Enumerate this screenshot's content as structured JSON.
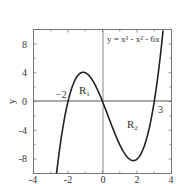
{
  "chart_data": {
    "type": "line",
    "title": "",
    "equation_label": "y = x³ - x² - 6x",
    "xlabel": "",
    "ylabel": "y",
    "xlim": [
      -4,
      4
    ],
    "ylim": [
      -10,
      10
    ],
    "xticks": [
      -4,
      -2,
      0,
      2,
      4
    ],
    "yticks": [
      -8,
      -4,
      0,
      4,
      8
    ],
    "xtick_labels": [
      "-4",
      "-2",
      "0",
      "2",
      "4"
    ],
    "ytick_labels": [
      "-8",
      "-4",
      "0",
      "4",
      "8"
    ],
    "grid": false,
    "series": [
      {
        "name": "y = x^3 - x^2 - 6x",
        "function": "x^3 - x^2 - 6x",
        "x": [
          -2.6,
          -2.4,
          -2.2,
          -2.0,
          -1.8,
          -1.6,
          -1.4,
          -1.2,
          -1.0,
          -0.8,
          -0.6,
          -0.4,
          -0.2,
          0.0,
          0.2,
          0.4,
          0.6,
          0.8,
          1.0,
          1.2,
          1.4,
          1.6,
          1.8,
          2.0,
          2.2,
          2.4,
          2.6,
          2.8,
          3.0,
          3.2,
          3.4
        ],
        "values": [
          -8.866,
          -5.184,
          -2.248,
          0.0,
          1.608,
          2.624,
          3.136,
          3.168,
          4.0,
          3.648,
          3.024,
          2.176,
          1.152,
          0.0,
          -1.232,
          -2.496,
          -3.744,
          -4.928,
          -6.0,
          -6.912,
          -7.616,
          -8.064,
          -8.208,
          -8.0,
          -7.392,
          -6.336,
          -4.784,
          -2.688,
          0.0,
          3.328,
          7.344
        ]
      }
    ],
    "annotations": [
      {
        "text": "-2",
        "x": -2.0,
        "y": 0,
        "role": "root label"
      },
      {
        "text": "3",
        "x": 3.0,
        "y": 0,
        "role": "root label"
      },
      {
        "text": "R1",
        "role": "region label",
        "region": "between x=-2 and x=0, above x-axis"
      },
      {
        "text": "R2",
        "role": "region label",
        "region": "between x=0 and x=3, below x-axis"
      }
    ],
    "axis_lines": {
      "x_zero": true,
      "y_zero": true
    }
  },
  "labels": {
    "equation": "y = x³ - x² - 6x",
    "ylabel": "y",
    "root_left": "−2",
    "root_right": "3",
    "region1_main": "R",
    "region1_sub": "1",
    "region2_main": "R",
    "region2_sub": "2",
    "xticks": [
      "-4",
      "-2",
      "0",
      "2",
      "4"
    ],
    "yticks": [
      "8",
      "4",
      "0",
      "-4",
      "-8"
    ]
  },
  "colors": {
    "curve": "#222222",
    "axis": "#555555",
    "frame": "#666666",
    "text": "#333333"
  }
}
